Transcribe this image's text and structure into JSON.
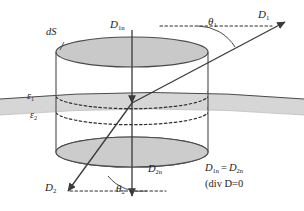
{
  "figure": {
    "colors": {
      "line": "#3a3a3a",
      "fill_ellipse": "#c9c9c9",
      "fill_slab": "#d4d4d4",
      "text": "#1c1c1c",
      "background": "#ffffff",
      "dashed": "#2e2e2e"
    },
    "labels": {
      "surface_element": {
        "base": "dS",
        "sub": ""
      },
      "d1n_top": {
        "base": "D",
        "sub": "1n"
      },
      "theta1": {
        "base": "θ",
        "sub": "1"
      },
      "d1_vector": {
        "base": "D",
        "sub": "1"
      },
      "epsilon1": {
        "base": "ε",
        "sub": "1"
      },
      "epsilon2": {
        "base": "ε",
        "sub": "2"
      },
      "d2_vector": {
        "base": "D",
        "sub": "2"
      },
      "theta2": {
        "base": "θ",
        "sub": "2"
      },
      "d2n_bottom": {
        "base": "D",
        "sub": "2n"
      },
      "equation_left": {
        "base": "D",
        "sub": "1n"
      },
      "equation_equals": "=",
      "equation_right": {
        "base": "D",
        "sub": "2n"
      },
      "divergence_note": "(div D=0"
    },
    "elements": {
      "cylinder_name": "pillbox-cylinder",
      "interface_name": "dielectric-interface-slab",
      "normal_axis_name": "normal-axis-arrow",
      "flux_vector_name": "d-field-vector-line"
    }
  }
}
